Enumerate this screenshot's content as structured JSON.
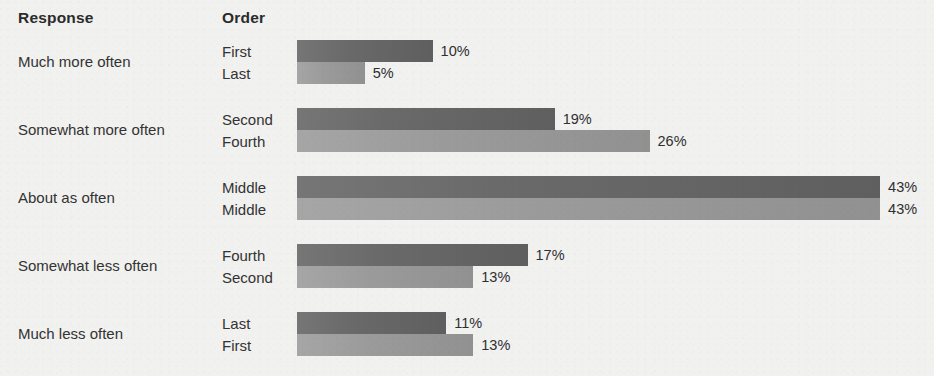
{
  "headers": {
    "response": "Response",
    "order": "Order"
  },
  "colors": {
    "background": "#f1f1ef",
    "bar_dark": "#666666",
    "bar_light": "#9a9a9a",
    "text": "#333333",
    "header_text": "#2b2b2b"
  },
  "chart_data": {
    "type": "bar",
    "title": "",
    "subtitle": "",
    "xlabel": "",
    "ylabel": "",
    "orientation": "horizontal",
    "grid": false,
    "legend_position": "none",
    "xlim": [
      0,
      43
    ],
    "value_unit": "%",
    "column_headers": [
      "Response",
      "Order"
    ],
    "categories": [
      "Much more often",
      "Somewhat more often",
      "About as often",
      "Somewhat less often",
      "Much less often"
    ],
    "series": [
      {
        "name": "First bar (dark)",
        "shade": "dark",
        "order_labels": [
          "First",
          "Second",
          "Middle",
          "Fourth",
          "Last"
        ],
        "values": [
          10,
          19,
          43,
          17,
          11
        ],
        "value_labels": [
          "10%",
          "19%",
          "43%",
          "17%",
          "11%"
        ]
      },
      {
        "name": "Second bar (light)",
        "shade": "light",
        "order_labels": [
          "Last",
          "Fourth",
          "Middle",
          "Second",
          "First"
        ],
        "values": [
          5,
          26,
          43,
          13,
          13
        ],
        "value_labels": [
          "5%",
          "26%",
          "43%",
          "13%",
          "13%"
        ]
      }
    ],
    "groups": [
      {
        "response": "Much more often",
        "rows": [
          {
            "order": "First",
            "value": 10,
            "value_label": "10%",
            "shade": "dark"
          },
          {
            "order": "Last",
            "value": 5,
            "value_label": "5%",
            "shade": "light"
          }
        ]
      },
      {
        "response": "Somewhat more often",
        "rows": [
          {
            "order": "Second",
            "value": 19,
            "value_label": "19%",
            "shade": "dark"
          },
          {
            "order": "Fourth",
            "value": 26,
            "value_label": "26%",
            "shade": "light"
          }
        ]
      },
      {
        "response": "About as often",
        "rows": [
          {
            "order": "Middle",
            "value": 43,
            "value_label": "43%",
            "shade": "dark"
          },
          {
            "order": "Middle",
            "value": 43,
            "value_label": "43%",
            "shade": "light"
          }
        ]
      },
      {
        "response": "Somewhat less often",
        "rows": [
          {
            "order": "Fourth",
            "value": 17,
            "value_label": "17%",
            "shade": "dark"
          },
          {
            "order": "Second",
            "value": 13,
            "value_label": "13%",
            "shade": "light"
          }
        ]
      },
      {
        "response": "Much less often",
        "rows": [
          {
            "order": "Last",
            "value": 11,
            "value_label": "11%",
            "shade": "dark"
          },
          {
            "order": "First",
            "value": 13,
            "value_label": "13%",
            "shade": "light"
          }
        ]
      }
    ]
  },
  "layout": {
    "bar_origin_x": 297,
    "px_per_percent": 13.56,
    "bar_height": 22,
    "group_tops": [
      40,
      108,
      176,
      244,
      312
    ],
    "label_gap": 8
  }
}
